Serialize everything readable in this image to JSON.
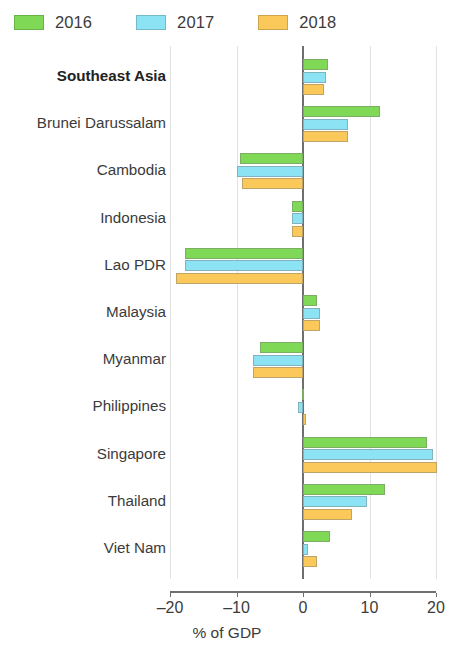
{
  "legend": {
    "position": "top-left",
    "entries": [
      {
        "label": "2016",
        "color": "#7FD957"
      },
      {
        "label": "2017",
        "color": "#8BE3F4"
      },
      {
        "label": "2018",
        "color": "#FBC85A"
      }
    ]
  },
  "axis": {
    "title": "% of GDP",
    "ticks": [
      "–20",
      "–10",
      "0",
      "10",
      "20"
    ],
    "tick_values": [
      -20,
      -10,
      0,
      10,
      20
    ]
  },
  "chart_data": {
    "type": "bar",
    "orientation": "horizontal",
    "title": "",
    "subtitle": "",
    "xlabel": "% of GDP",
    "ylabel": "",
    "xlim": [
      -20,
      20
    ],
    "grid": true,
    "legend_position": "top-left",
    "categories": [
      "Southeast Asia",
      "Brunei Darussalam",
      "Cambodia",
      "Indonesia",
      "Lao PDR",
      "Malaysia",
      "Myanmar",
      "Philippines",
      "Singapore",
      "Thailand",
      "Viet Nam"
    ],
    "highlight_category": "Southeast Asia",
    "series": [
      {
        "name": "2016",
        "color": "#7FD957",
        "values": [
          3.8,
          11.6,
          -9.5,
          -1.6,
          -17.7,
          2.1,
          -6.5,
          -0.2,
          18.6,
          12.3,
          4.1
        ]
      },
      {
        "name": "2017",
        "color": "#8BE3F4",
        "values": [
          3.5,
          6.8,
          -9.9,
          -1.6,
          -17.7,
          2.6,
          -7.5,
          -0.7,
          19.5,
          9.6,
          0.8
        ]
      },
      {
        "name": "2018",
        "color": "#FBC85A",
        "values": [
          3.1,
          6.8,
          -9.2,
          -1.7,
          -19.1,
          2.6,
          -7.5,
          0.5,
          20.1,
          7.4,
          2.1
        ]
      }
    ]
  }
}
